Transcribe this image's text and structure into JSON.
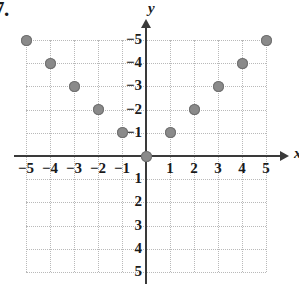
{
  "problem": {
    "number": "7."
  },
  "axes": {
    "x_name": "x",
    "y_name": "y",
    "x_tick_labels": [
      "−5",
      "−4",
      "−3",
      "−2",
      "−1",
      "1",
      "2",
      "3",
      "4",
      "5"
    ],
    "y_tick_labels": [
      "5",
      "4",
      "3",
      "2",
      "1",
      "−1",
      "−2",
      "−3",
      "−4",
      "−5"
    ]
  },
  "colors": {
    "point_fill": "#8a8a8a",
    "point_edge": "#6f6f6f",
    "axis": "#3a3a3a",
    "grid": "#b9b9b9",
    "text": "#1a1a1a",
    "background": "#ffffff"
  },
  "chart_data": {
    "type": "scatter",
    "title": "",
    "xlabel": "x",
    "ylabel": "y",
    "xlim": [
      -5,
      5
    ],
    "ylim": [
      -5,
      5
    ],
    "xticks": [
      -5,
      -4,
      -3,
      -2,
      -1,
      1,
      2,
      3,
      4,
      5
    ],
    "yticks": [
      -5,
      -4,
      -3,
      -2,
      -1,
      1,
      2,
      3,
      4,
      5
    ],
    "grid": true,
    "legend": null,
    "series": [
      {
        "name": "points",
        "points": [
          [
            -5,
            5
          ],
          [
            -4,
            4
          ],
          [
            -3,
            3
          ],
          [
            -2,
            2
          ],
          [
            -1,
            1
          ],
          [
            0,
            0
          ],
          [
            1,
            1
          ],
          [
            2,
            2
          ],
          [
            3,
            3
          ],
          [
            4,
            4
          ],
          [
            5,
            5
          ]
        ]
      }
    ]
  }
}
